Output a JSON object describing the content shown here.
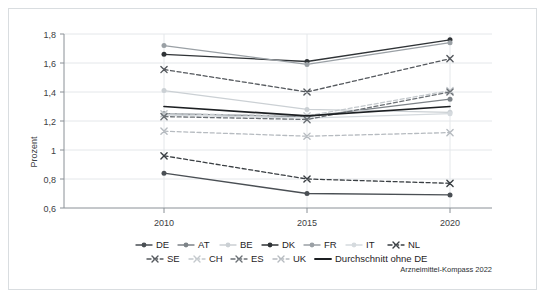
{
  "credit": "Arzneimittel-Kompass 2022",
  "chart_data": {
    "type": "line",
    "title": "",
    "xlabel": "",
    "ylabel": "Prozent",
    "x": [
      2010,
      2015,
      2020
    ],
    "categories": [
      "2010",
      "2015",
      "2020"
    ],
    "xtick_labels": [
      "2010",
      "2015",
      "2020"
    ],
    "ytick_labels": [
      "0,6",
      "0,8",
      "1",
      "1,2",
      "1,4",
      "1,6",
      "1,8"
    ],
    "ytick_values": [
      0.6,
      0.8,
      1.0,
      1.2,
      1.4,
      1.6,
      1.8
    ],
    "ylim": [
      0.6,
      1.8
    ],
    "grid": true,
    "legend_position": "bottom",
    "series": [
      {
        "name": "DE",
        "values": [
          0.84,
          0.7,
          0.69
        ],
        "color": "#4a4f54",
        "dash": "solid",
        "marker": "circle"
      },
      {
        "name": "AT",
        "values": [
          1.25,
          1.23,
          1.35
        ],
        "color": "#7d8388",
        "dash": "solid",
        "marker": "circle"
      },
      {
        "name": "BE",
        "values": [
          1.41,
          1.28,
          1.26
        ],
        "color": "#cbd0d4",
        "dash": "solid",
        "marker": "circle"
      },
      {
        "name": "DK",
        "values": [
          1.66,
          1.61,
          1.76
        ],
        "color": "#2f3336",
        "dash": "solid",
        "marker": "circle"
      },
      {
        "name": "FR",
        "values": [
          1.72,
          1.59,
          1.74
        ],
        "color": "#9aa0a5",
        "dash": "solid",
        "marker": "circle"
      },
      {
        "name": "IT",
        "values": [
          1.24,
          1.22,
          1.25
        ],
        "color": "#d5dade",
        "dash": "solid",
        "marker": "circle"
      },
      {
        "name": "NL",
        "values": [
          0.96,
          0.8,
          0.77
        ],
        "color": "#3a3f43",
        "dash": "dashed",
        "marker": "x"
      },
      {
        "name": "SE",
        "values": [
          1.555,
          1.4,
          1.63
        ],
        "color": "#55595e",
        "dash": "dashed",
        "marker": "x"
      },
      {
        "name": "CH",
        "values": [
          1.25,
          1.235,
          1.41
        ],
        "color": "#c4c9cd",
        "dash": "dashed",
        "marker": "x"
      },
      {
        "name": "ES",
        "values": [
          1.23,
          1.21,
          1.4
        ],
        "color": "#6b7075",
        "dash": "dashed",
        "marker": "x"
      },
      {
        "name": "UK",
        "values": [
          1.13,
          1.095,
          1.12
        ],
        "color": "#b6bbc0",
        "dash": "dashed",
        "marker": "x"
      },
      {
        "name": "Durchschnitt ohne DE",
        "values": [
          1.3,
          1.235,
          1.3
        ],
        "color": "#1c1f22",
        "dash": "solid",
        "marker": "none"
      }
    ]
  },
  "legend": {
    "row1": [
      "DE",
      "AT",
      "BE",
      "DK",
      "FR",
      "IT",
      "NL"
    ],
    "row2": [
      "SE",
      "CH",
      "ES",
      "UK",
      "Durchschnitt ohne DE"
    ]
  }
}
